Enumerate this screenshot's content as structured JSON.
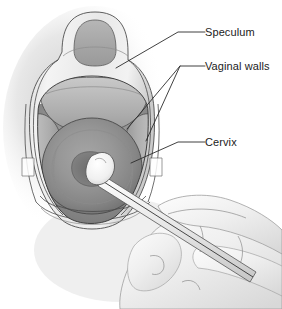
{
  "figure": {
    "background_color": "#ffffff",
    "line_color": "#2b2b2b",
    "text_color": "#1c1c1c"
  },
  "labels": [
    {
      "id": "speculum",
      "text": "Speculum",
      "text_x": 205,
      "text_y": 36,
      "leader_points": "205,32 178,32 116,68",
      "target": "speculum-frame"
    },
    {
      "id": "vaginal-walls",
      "text": "Vaginal walls",
      "text_x": 205,
      "text_y": 70,
      "leader_points": "205,66 180,66 127,129",
      "leader_points_branch": "180,66 146,141",
      "target": "vaginal-wall-folds"
    },
    {
      "id": "cervix",
      "text": "Cervix",
      "text_x": 205,
      "text_y": 145,
      "leader_points": "205,142 178,142 131,163",
      "target": "cervix-body"
    }
  ],
  "anatomy": {
    "speculum": {
      "name": "speculum",
      "color": "#e3e3e3",
      "shade_color": "#cfcfcf",
      "handle_color": "#a9a9a9"
    },
    "vaginal_canal": {
      "name": "vaginal canal",
      "color": "#9a9a9a"
    },
    "vaginal_walls": {
      "name": "vaginal walls",
      "color": "#b4b4b4"
    },
    "cervix": {
      "name": "cervix",
      "color": "#8f8f8f",
      "os_color": "#6f6f6f"
    },
    "swab": {
      "name": "collection swab",
      "tip_color": "#f2f2f2",
      "stick_color": "#dcdcdc"
    },
    "hand": {
      "name": "clinician hand",
      "color": "#f3f3f3",
      "shade_color": "#dddddd"
    },
    "shadow": {
      "name": "background shadow",
      "color": "#d9d9d9"
    }
  }
}
